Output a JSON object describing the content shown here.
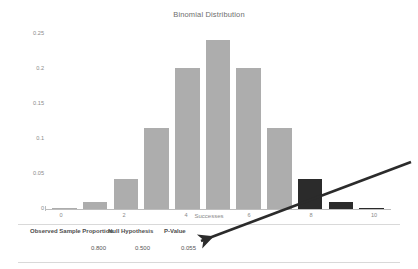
{
  "chart_data": {
    "type": "bar",
    "title": "Binomial Distribution",
    "xlabel": "Successes",
    "ylabel": "Probability",
    "categories": [
      "0",
      "1",
      "2",
      "3",
      "4",
      "5",
      "6",
      "7",
      "8",
      "9",
      "10"
    ],
    "values": [
      0.001,
      0.01,
      0.044,
      0.117,
      0.205,
      0.246,
      0.205,
      0.117,
      0.044,
      0.01,
      0.001
    ],
    "bar_colors": [
      "#adadad",
      "#adadad",
      "#adadad",
      "#adadad",
      "#adadad",
      "#adadad",
      "#adadad",
      "#adadad",
      "#2b2b2b",
      "#2b2b2b",
      "#2b2b2b"
    ],
    "highlight_color": "#2b2b2b",
    "base_color": "#adadad",
    "xticks": [
      "0",
      "2",
      "4",
      "6",
      "8",
      "10"
    ],
    "xtick_values": [
      0,
      2,
      4,
      6,
      8,
      10
    ],
    "yticks": [
      "0",
      "0.05",
      "0.1",
      "0.15",
      "0.2",
      "0.25"
    ],
    "ytick_values": [
      0,
      0.05,
      0.1,
      0.15,
      0.2,
      0.25
    ],
    "ylim": [
      0,
      0.26
    ],
    "xlim": [
      -0.6,
      10.6
    ],
    "grid": false,
    "legend": false
  },
  "chart": {
    "title": "Binomial Distribution",
    "xlabel": "Successes",
    "ylabel": "Probability"
  },
  "yticks": [
    {
      "label": "0.25"
    },
    {
      "label": "0.2"
    },
    {
      "label": "0.15"
    },
    {
      "label": "0.1"
    },
    {
      "label": "0.05"
    },
    {
      "label": "0"
    }
  ],
  "xticks": [
    {
      "label": "0"
    },
    {
      "label": "2"
    },
    {
      "label": "4"
    },
    {
      "label": "6"
    },
    {
      "label": "8"
    },
    {
      "label": "10"
    }
  ],
  "summary_table": {
    "headers": [
      {
        "label": "Observed Sample Proportion"
      },
      {
        "label": "Null Hypothesis"
      },
      {
        "label": "P-Value"
      }
    ],
    "values": [
      {
        "label": "0.800"
      },
      {
        "label": "0.500"
      },
      {
        "label": "0.055"
      }
    ]
  },
  "annotation": {
    "arrow_color": "#2b2b2b",
    "points_to": "P-Value"
  }
}
